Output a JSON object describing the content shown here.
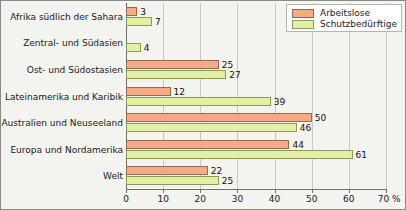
{
  "chart_data": {
    "type": "bar",
    "orientation": "horizontal",
    "title": "",
    "xlabel": "%",
    "ylabel": "",
    "xlim": [
      0,
      70
    ],
    "xticks": [
      0,
      10,
      20,
      30,
      40,
      50,
      60,
      70
    ],
    "xtick_labels": [
      "0",
      "10",
      "20",
      "30",
      "40",
      "50",
      "60",
      "70 %"
    ],
    "axis_unit_suffix": "%",
    "grid": true,
    "grid_axis": "x",
    "legend_position": "top-right",
    "categories": [
      "Afrika südlich der Sahara",
      "Zentral- und Südasien",
      "Ost- und Südostasien",
      "Lateinamerika und Karibik",
      "Australien und Neuseeland",
      "Europa und Nordamerika",
      "Welt"
    ],
    "series": [
      {
        "name": "Arbeitslose",
        "color": "#f4ab85",
        "values": [
          3,
          null,
          25,
          12,
          50,
          44,
          22
        ],
        "labels": [
          "3",
          "",
          "25",
          "12",
          "50",
          "44",
          "22"
        ]
      },
      {
        "name": "Schutzbedürftige",
        "color": "#e3efa4",
        "values": [
          7,
          4,
          27,
          39,
          46,
          61,
          25
        ],
        "labels": [
          "7",
          "4",
          "27",
          "39",
          "46",
          "61",
          "25"
        ]
      }
    ]
  },
  "legend": {
    "items": [
      {
        "label": "Arbeitslose",
        "swatch": "s-unemployed"
      },
      {
        "label": "Schutzbedürftige",
        "swatch": "s-protection"
      }
    ]
  },
  "colors": {
    "series_unemployed": "#f4ab85",
    "series_protection": "#e3efa4",
    "background": "#f3f3ef",
    "grid": "#c9c9c4",
    "axis": "#6e6e6a",
    "text": "#1a1a1a"
  }
}
